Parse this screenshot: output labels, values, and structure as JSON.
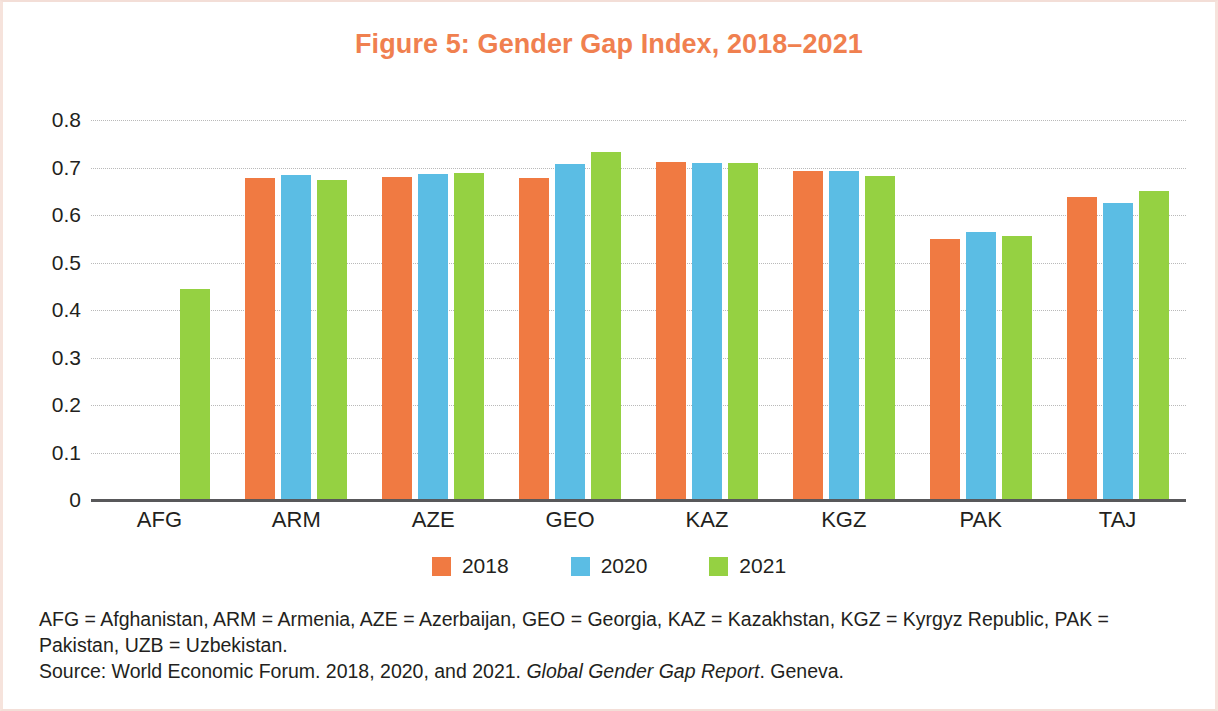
{
  "chart_data": {
    "type": "bar",
    "title": "Figure 5: Gender Gap Index, 2018–2021",
    "xlabel": "",
    "ylabel": "",
    "ylim": [
      0,
      0.8
    ],
    "yticks": [
      "0",
      "0.1",
      "0.2",
      "0.3",
      "0.4",
      "0.5",
      "0.6",
      "0.7",
      "0.8"
    ],
    "ytick_values": [
      0,
      0.1,
      0.2,
      0.3,
      0.4,
      0.5,
      0.6,
      0.7,
      0.8
    ],
    "grid": true,
    "legend_position": "bottom",
    "categories": [
      "AFG",
      "ARM",
      "AZE",
      "GEO",
      "KAZ",
      "KGZ",
      "PAK",
      "TAJ"
    ],
    "series": [
      {
        "name": "2018",
        "color": "#f07a42",
        "values": [
          null,
          0.678,
          0.679,
          0.677,
          0.712,
          0.693,
          0.55,
          0.638
        ]
      },
      {
        "name": "2020",
        "color": "#5bbde4",
        "values": [
          null,
          0.684,
          0.687,
          0.708,
          0.71,
          0.692,
          0.564,
          0.626
        ]
      },
      {
        "name": "2021",
        "color": "#95d142",
        "values": [
          0.444,
          0.673,
          0.688,
          0.732,
          0.71,
          0.682,
          0.556,
          0.65
        ]
      }
    ]
  },
  "title": {
    "text": "Figure 5: Gender Gap Index, 2018–2021",
    "color": "#f0804f"
  },
  "legend": {
    "items": [
      {
        "label": "2018",
        "color": "#f07a42"
      },
      {
        "label": "2020",
        "color": "#5bbde4"
      },
      {
        "label": "2021",
        "color": "#95d142"
      }
    ]
  },
  "footnotes": {
    "abbreviations": "AFG = Afghanistan, ARM = Armenia, AZE = Azerbaijan, GEO = Georgia, KAZ = Kazakhstan, KGZ = Kyrgyz Republic, PAK = Pakistan, UZB = Uzbekistan.",
    "source_prefix": "Source: World Economic Forum. 2018, 2020, and 2021. ",
    "source_italic": "Global Gender Gap Report",
    "source_suffix": ". Geneva."
  }
}
